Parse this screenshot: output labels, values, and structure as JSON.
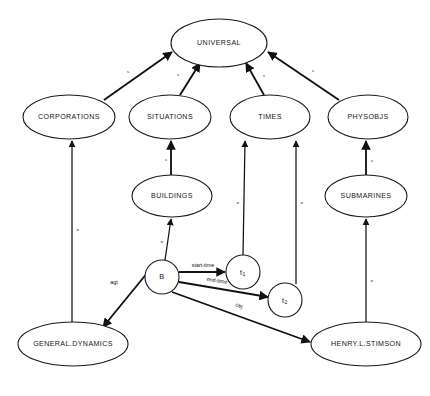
{
  "diagram": {
    "background_color": "#ffffff",
    "line_color": "#111111",
    "text_color": "#151515",
    "nodes": [
      {
        "id": "universal",
        "label": "UNIVERSAL",
        "kind": "concept",
        "cx": 219,
        "cy": 43,
        "rx": 48,
        "ry": 24
      },
      {
        "id": "corporations",
        "label": "CORPORATIONS",
        "kind": "concept",
        "cx": 69,
        "cy": 117,
        "rx": 46,
        "ry": 22
      },
      {
        "id": "situations",
        "label": "SITUATIONS",
        "kind": "concept",
        "cx": 170,
        "cy": 117,
        "rx": 41,
        "ry": 22
      },
      {
        "id": "times",
        "label": "TIMES",
        "kind": "concept",
        "cx": 270,
        "cy": 117,
        "rx": 40,
        "ry": 22
      },
      {
        "id": "physobjs",
        "label": "PHYSOBJS",
        "kind": "concept",
        "cx": 368,
        "cy": 117,
        "rx": 40,
        "ry": 22
      },
      {
        "id": "buildings",
        "label": "BUILDINGS",
        "kind": "concept",
        "cx": 172,
        "cy": 196,
        "rx": 40,
        "ry": 21
      },
      {
        "id": "submarines",
        "label": "SUBMARINES",
        "kind": "concept",
        "cx": 366,
        "cy": 196,
        "rx": 41,
        "ry": 21
      },
      {
        "id": "b",
        "label": "B",
        "kind": "instance",
        "cx": 162,
        "cy": 277,
        "rx": 17,
        "ry": 17
      },
      {
        "id": "t1",
        "label": "t",
        "sub": "1",
        "kind": "instance",
        "cx": 243,
        "cy": 272,
        "rx": 17,
        "ry": 17
      },
      {
        "id": "t2",
        "label": "t",
        "sub": "2",
        "kind": "instance",
        "cx": 285,
        "cy": 300,
        "rx": 17,
        "ry": 17
      },
      {
        "id": "generaldyn",
        "label": "GENERAL.DYNAMICS",
        "kind": "concept",
        "cx": 73,
        "cy": 344,
        "rx": 55,
        "ry": 22
      },
      {
        "id": "henrystimson",
        "label": "HENRY.L.STIMSON",
        "kind": "concept",
        "cx": 366,
        "cy": 344,
        "rx": 55,
        "ry": 22
      }
    ],
    "edges": [
      {
        "id": "corporations-universal",
        "from": "CORPORATIONS",
        "to": "UNIVERSAL",
        "label": "s",
        "x1": 104,
        "y1": 100,
        "x2": 172,
        "y2": 52,
        "lx": 128,
        "ly": 72,
        "weight": "thick"
      },
      {
        "id": "situations-universal",
        "from": "SITUATIONS",
        "to": "UNIVERSAL",
        "label": "s",
        "x1": 180,
        "y1": 95,
        "x2": 200,
        "y2": 63,
        "lx": 178,
        "ly": 75,
        "weight": "thick"
      },
      {
        "id": "times-universal",
        "from": "TIMES",
        "to": "UNIVERSAL",
        "label": "s",
        "x1": 264,
        "y1": 95,
        "x2": 246,
        "y2": 63,
        "lx": 264,
        "ly": 76,
        "weight": "thick"
      },
      {
        "id": "physobjs-universal",
        "from": "PHYSOBJS",
        "to": "UNIVERSAL",
        "label": "s",
        "x1": 339,
        "y1": 100,
        "x2": 268,
        "y2": 52,
        "lx": 313,
        "ly": 71,
        "weight": "thick"
      },
      {
        "id": "buildings-situations",
        "from": "BUILDINGS",
        "to": "SITUATIONS",
        "label": "s",
        "x1": 171,
        "y1": 175,
        "x2": 171,
        "y2": 141,
        "lx": 166,
        "ly": 160,
        "weight": "thick"
      },
      {
        "id": "submarines-physobjs",
        "from": "SUBMARINES",
        "to": "PHYSOBJS",
        "label": "s",
        "x1": 366,
        "y1": 175,
        "x2": 366,
        "y2": 141,
        "lx": 372,
        "ly": 161,
        "weight": "thick"
      },
      {
        "id": "generaldyn-corporations",
        "from": "GENERAL.DYNAMICS",
        "to": "CORPORATIONS",
        "label": "e",
        "x1": 72,
        "y1": 322,
        "x2": 72,
        "y2": 141,
        "lx": 78,
        "ly": 230,
        "weight": "thin"
      },
      {
        "id": "henrystimson-submarines",
        "from": "HENRY.L.STIMSON",
        "to": "SUBMARINES",
        "label": "e",
        "x1": 366,
        "y1": 322,
        "x2": 366,
        "y2": 219,
        "lx": 372,
        "ly": 281,
        "weight": "thin"
      },
      {
        "id": "b-buildings",
        "from": "B",
        "to": "BUILDINGS",
        "label": "e",
        "x1": 165,
        "y1": 260,
        "x2": 171,
        "y2": 219,
        "lx": 162,
        "ly": 242,
        "weight": "thin"
      },
      {
        "id": "t1-times",
        "from": "t1",
        "to": "TIMES",
        "label": "e",
        "x1": 243,
        "y1": 255,
        "x2": 245,
        "y2": 141,
        "lx": 238,
        "ly": 203,
        "weight": "thin"
      },
      {
        "id": "t2-times",
        "from": "t2",
        "to": "TIMES",
        "label": "e",
        "x1": 296,
        "y1": 284,
        "x2": 296,
        "y2": 141,
        "lx": 302,
        "ly": 203,
        "weight": "thin"
      },
      {
        "id": "b-t1",
        "from": "B",
        "to": "t1",
        "label": "start-time",
        "x1": 179,
        "y1": 272,
        "x2": 225,
        "y2": 272,
        "lx": 203,
        "ly": 266,
        "weight": "thick"
      },
      {
        "id": "b-t2",
        "from": "B",
        "to": "t2",
        "label": "end-time",
        "x1": 179,
        "y1": 282,
        "x2": 268,
        "y2": 297,
        "lx": 217,
        "ly": 281,
        "weight": "thick"
      },
      {
        "id": "b-henrystimson",
        "from": "B",
        "to": "HENRY.L.STIMSON",
        "label": "obj",
        "x1": 172,
        "y1": 292,
        "x2": 310,
        "y2": 342,
        "lx": 239,
        "ly": 306,
        "weight": "thick"
      },
      {
        "id": "b-generaldyn",
        "from": "B",
        "to": "GENERAL.DYNAMICS",
        "label": "agt",
        "x1": 148,
        "y1": 272,
        "x2": 103,
        "y2": 327,
        "lx": 114,
        "ly": 283,
        "weight": "thick"
      }
    ]
  }
}
